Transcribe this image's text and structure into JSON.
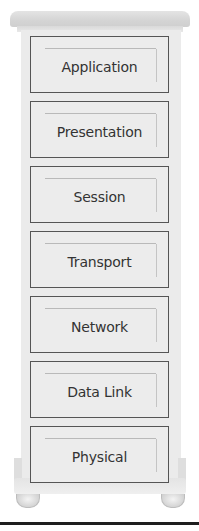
{
  "diagram": {
    "type": "osi-model-chest-of-drawers",
    "layers": [
      {
        "label": "Application",
        "top": 36
      },
      {
        "label": "Presentation",
        "top": 101
      },
      {
        "label": "Session",
        "top": 166
      },
      {
        "label": "Transport",
        "top": 231
      },
      {
        "label": "Network",
        "top": 296
      },
      {
        "label": "Data Link",
        "top": 361
      },
      {
        "label": "Physical",
        "top": 426
      }
    ]
  },
  "colors": {
    "cabinet": "#ebebeb",
    "drawer_border": "#555555",
    "text": "#333333",
    "rule": "#1e1e1e"
  }
}
